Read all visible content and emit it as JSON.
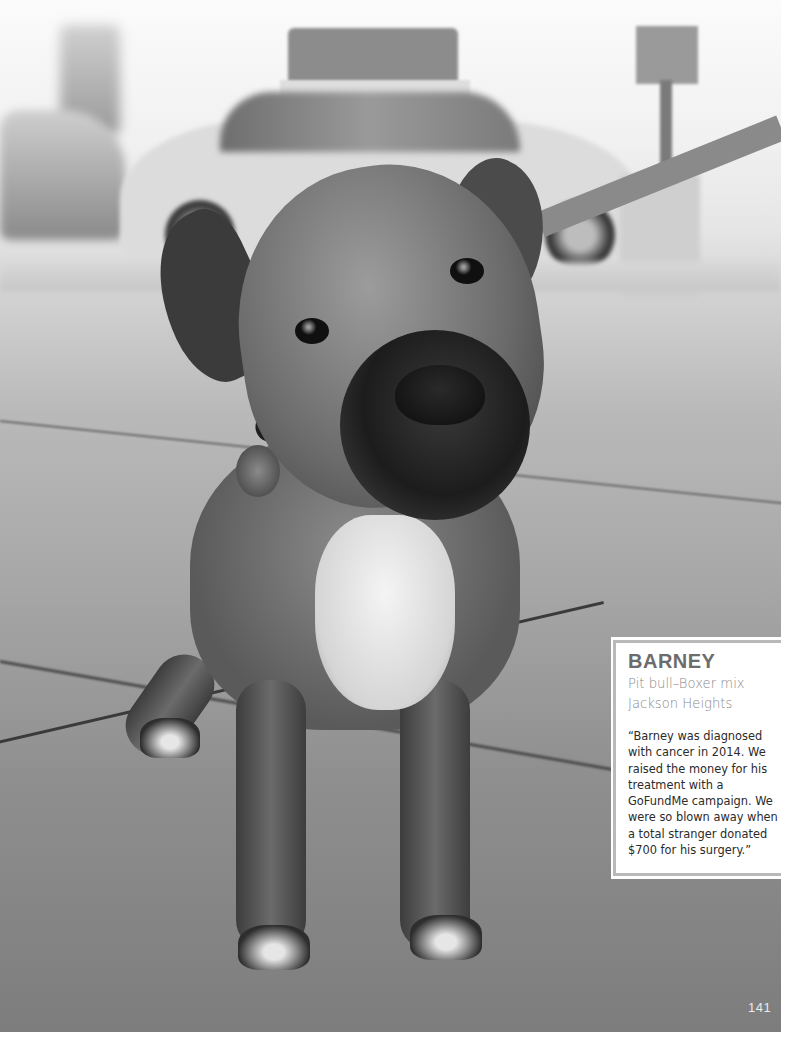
{
  "photo": {
    "subject": "dog-photo",
    "description": "Black-and-white photo of a pit bull–boxer mix dog on a sidewalk with a taxi in the background"
  },
  "card": {
    "name": "BARNEY",
    "breed": "Pit bull–Boxer mix",
    "location": "Jackson Heights",
    "quote": "“Barney was diagnosed with cancer in 2014. We raised the money for his treatment with a GoFundMe campaign. We were so blown away when a total stranger donated $700 for his surgery.”"
  },
  "page": {
    "number": "141"
  }
}
